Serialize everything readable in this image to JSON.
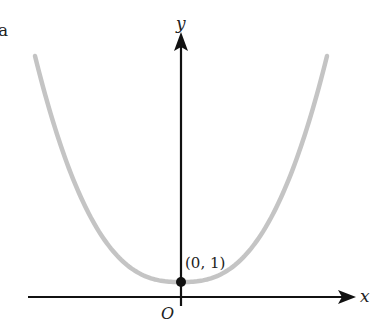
{
  "chart_data": {
    "type": "line",
    "title": "",
    "xlabel": "x",
    "ylabel": "y",
    "origin_label": "O",
    "panel_label": "a",
    "curve": {
      "description": "U-shaped even function with minimum at (0, 1), flat near vertex (quartic-like)",
      "color": "#c4c4c4",
      "vertex": {
        "x": 0,
        "y": 1
      },
      "symmetric_about_y_axis": true
    },
    "annotations": [
      {
        "text": "(0, 1)",
        "x": 0,
        "y": 1,
        "marker": "filled-dot"
      }
    ],
    "grid": false,
    "axes_arrows": true,
    "ticks": []
  },
  "labels": {
    "x_axis": "x",
    "y_axis": "y",
    "origin": "O",
    "point": "(0, 1)",
    "panel": "a"
  },
  "colors": {
    "curve": "#c4c4c4",
    "axis": "#111111",
    "point": "#111111"
  }
}
